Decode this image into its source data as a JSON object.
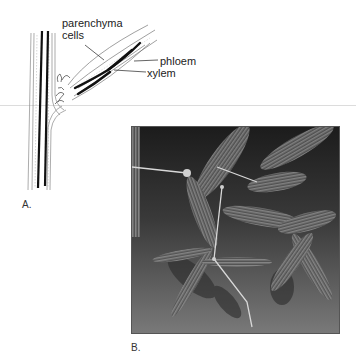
{
  "figure": {
    "panel_a": {
      "label": "A.",
      "annotations": {
        "parenchyma_line1": "parenchyma",
        "parenchyma_line2": "cells",
        "phloem": "phloem",
        "xylem": "xylem"
      }
    },
    "panel_b": {
      "label": "B."
    }
  }
}
